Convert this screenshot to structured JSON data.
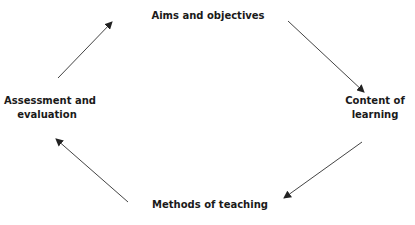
{
  "diagram": {
    "type": "cycle",
    "colors": {
      "text": "#1a1a1a",
      "arrow": "#333333",
      "background": "#ffffff"
    },
    "nodes": {
      "aims": {
        "lines": [
          "Aims and objectives"
        ]
      },
      "content": {
        "lines": [
          "Content of",
          "learning"
        ]
      },
      "methods": {
        "lines": [
          "Methods of teaching"
        ]
      },
      "assessment": {
        "lines": [
          "Assessment and",
          "evaluation"
        ]
      }
    },
    "edges": [
      {
        "from": "Assessment and evaluation",
        "to": "Aims and objectives"
      },
      {
        "from": "Aims and objectives",
        "to": "Content of learning"
      },
      {
        "from": "Content of learning",
        "to": "Methods of teaching"
      },
      {
        "from": "Methods of teaching",
        "to": "Assessment and evaluation"
      }
    ]
  }
}
